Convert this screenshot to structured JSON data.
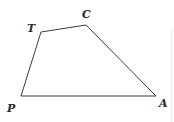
{
  "diagram": {
    "type": "quadrilateral",
    "stroke_color": "#3a3a3a",
    "vertices": [
      {
        "name": "T",
        "x": 41,
        "y": 32,
        "label_x": 27,
        "label_y": 32
      },
      {
        "name": "C",
        "x": 86,
        "y": 25,
        "label_x": 82,
        "label_y": 18
      },
      {
        "name": "A",
        "x": 156,
        "y": 96,
        "label_x": 159,
        "label_y": 107
      },
      {
        "name": "P",
        "x": 21,
        "y": 96,
        "label_x": 7,
        "label_y": 112
      }
    ],
    "labels": {
      "T": "T",
      "C": "C",
      "A": "A",
      "P": "P"
    }
  }
}
